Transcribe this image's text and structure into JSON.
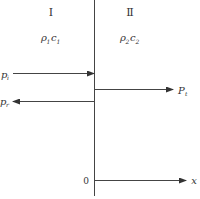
{
  "diagram": {
    "regions": [
      {
        "numeral": "Ⅰ",
        "medium": {
          "rho": "ρ",
          "rho_sub": "1",
          "c": "c",
          "c_sub": "1"
        }
      },
      {
        "numeral": "Ⅱ",
        "medium": {
          "rho": "ρ",
          "rho_sub": "2",
          "c": "c",
          "c_sub": "2"
        }
      }
    ],
    "waves": {
      "incident": {
        "symbol": "p",
        "sub": "i"
      },
      "reflected": {
        "symbol": "p",
        "sub": "r"
      },
      "transmitted": {
        "symbol": "P",
        "sub": "t"
      }
    },
    "axis": {
      "origin": "0",
      "label": "x"
    },
    "colors": {
      "line": "#333333"
    }
  }
}
